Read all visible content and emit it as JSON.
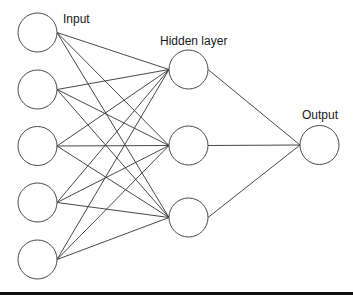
{
  "diagram": {
    "labels": {
      "input": "Input",
      "hidden": "Hidden layer",
      "output": "Output"
    },
    "layers": [
      {
        "name": "input",
        "nodes": [
          {
            "id": "in1",
            "cx": 37.5,
            "cy": 32.5
          },
          {
            "id": "in2",
            "cx": 37.5,
            "cy": 89.5
          },
          {
            "id": "in3",
            "cx": 37.5,
            "cy": 146
          },
          {
            "id": "in4",
            "cx": 37.5,
            "cy": 202.5
          },
          {
            "id": "in5",
            "cx": 37.5,
            "cy": 259.5
          }
        ]
      },
      {
        "name": "hidden",
        "nodes": [
          {
            "id": "h1",
            "cx": 188.5,
            "cy": 69.5
          },
          {
            "id": "h2",
            "cx": 188.5,
            "cy": 145.5
          },
          {
            "id": "h3",
            "cx": 188.5,
            "cy": 217.5
          }
        ]
      },
      {
        "name": "output",
        "nodes": [
          {
            "id": "out1",
            "cx": 319.5,
            "cy": 145
          }
        ]
      }
    ],
    "node_radius": 19.5,
    "connectivity": "fully-connected",
    "colors": {
      "node_stroke": "#4a4a4a",
      "edge": "#333333",
      "background": "#ffffff",
      "text": "#1a1a1a"
    }
  }
}
